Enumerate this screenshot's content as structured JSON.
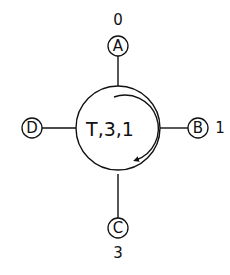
{
  "diagram": {
    "type": "switch-node",
    "center": {
      "label": "T,3,1",
      "rotation": "clockwise"
    },
    "ports": [
      {
        "id": "A",
        "letter": "A",
        "position": "top",
        "number": "0"
      },
      {
        "id": "B",
        "letter": "B",
        "position": "right",
        "number": "1"
      },
      {
        "id": "C",
        "letter": "C",
        "position": "bottom",
        "number": "3"
      },
      {
        "id": "D",
        "letter": "D",
        "position": "left",
        "number": ""
      }
    ],
    "colors": {
      "line": "#111111",
      "background": "#ffffff"
    }
  }
}
